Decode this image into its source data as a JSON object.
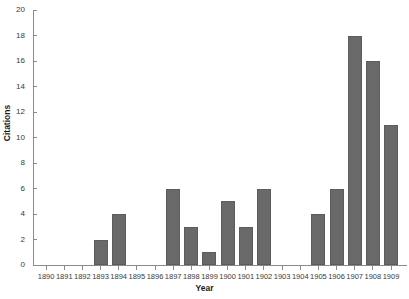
{
  "chart_data": {
    "type": "bar",
    "title": "",
    "xlabel": "Year",
    "ylabel": "Citations",
    "categories": [
      "1890",
      "1891",
      "1892",
      "1893",
      "1894",
      "1895",
      "1896",
      "1897",
      "1898",
      "1899",
      "1900",
      "1901",
      "1902",
      "1903",
      "1904",
      "1905",
      "1906",
      "1907",
      "1908",
      "1909"
    ],
    "values": [
      0,
      0,
      0,
      2,
      4,
      0,
      0,
      6,
      3,
      1,
      5,
      3,
      6,
      0,
      0,
      4,
      6,
      18,
      16,
      11
    ],
    "ylim": [
      0,
      20
    ],
    "yticks": [
      0,
      2,
      4,
      6,
      8,
      10,
      12,
      14,
      16,
      18,
      20
    ],
    "ytick_labels": [
      "0",
      "2",
      "4",
      "6",
      "8",
      "10",
      "12",
      "14",
      "16",
      "18",
      "20"
    ],
    "grid": false,
    "legend": false,
    "bar_color": "#696969",
    "axis_color": "#8a8a8a"
  }
}
